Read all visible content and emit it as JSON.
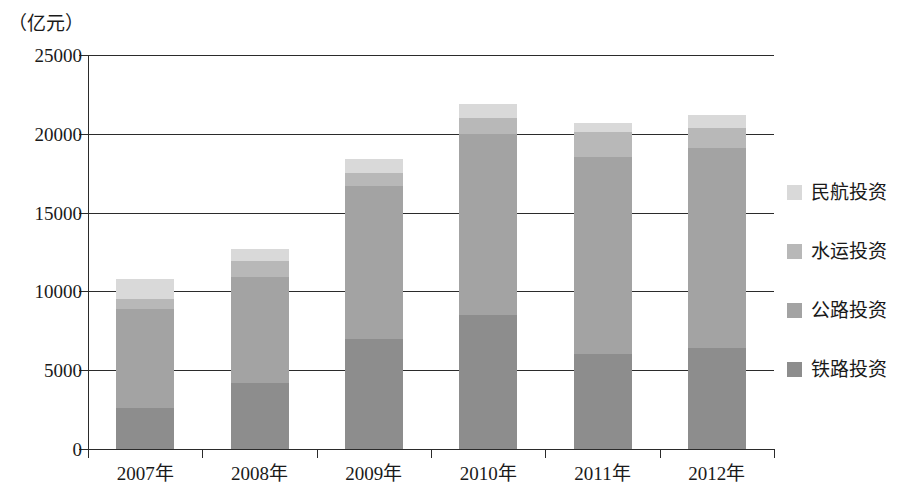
{
  "chart_data": {
    "type": "bar",
    "subtype": "stacked-vertical",
    "title": "",
    "unit_label": "（亿元）",
    "xlabel": "",
    "ylabel": "",
    "categories": [
      "2007年",
      "2008年",
      "2009年",
      "2010年",
      "2011年",
      "2012年"
    ],
    "ylim": [
      0,
      25000
    ],
    "ytick_labels": [
      "0",
      "5000",
      "10000",
      "15000",
      "20000",
      "25000"
    ],
    "ytick_values": [
      0,
      5000,
      10000,
      15000,
      20000,
      25000
    ],
    "grid": true,
    "grid_axis": "y",
    "legend_position": "right",
    "stack_order_bottom_to_top": [
      "铁路投资",
      "公路投资",
      "水运投资",
      "民航投资"
    ],
    "series": [
      {
        "name": "铁路投资",
        "color": "#8d8d8d",
        "values": [
          2600,
          4200,
          7000,
          8500,
          6000,
          6400
        ]
      },
      {
        "name": "公路投资",
        "color": "#a3a3a3",
        "values": [
          6300,
          6700,
          9700,
          11500,
          12500,
          12700
        ]
      },
      {
        "name": "水运投资",
        "color": "#b8b8b8",
        "values": [
          600,
          1000,
          800,
          1000,
          1600,
          1300
        ]
      },
      {
        "name": "民航投资",
        "color": "#d9d9d9",
        "values": [
          1300,
          800,
          900,
          900,
          600,
          800
        ]
      }
    ],
    "totals": [
      10800,
      12700,
      18400,
      21900,
      20700,
      21200
    ]
  },
  "legend": {
    "items": [
      {
        "label": "民航投资",
        "color": "#d9d9d9"
      },
      {
        "label": "水运投资",
        "color": "#b8b8b8"
      },
      {
        "label": "公路投资",
        "color": "#a3a3a3"
      },
      {
        "label": "铁路投资",
        "color": "#8d8d8d"
      }
    ]
  },
  "axis_color": "#2b2b2b"
}
